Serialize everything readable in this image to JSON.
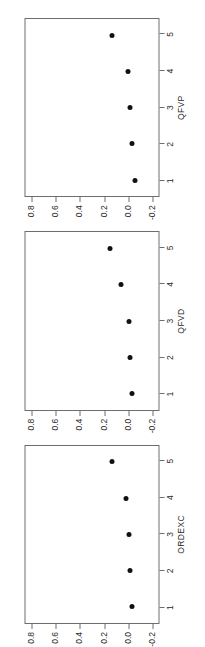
{
  "figure": {
    "orientation": "rotated-90-ccw",
    "background_color": "#ffffff",
    "axis_color": "#6e6e6e",
    "point_color": "#111111"
  },
  "chart_data": [
    {
      "type": "scatter",
      "title": "",
      "xlabel": "ORDEXC",
      "ylabel": "",
      "x": [
        1,
        2,
        3,
        4,
        5
      ],
      "categories": [
        "1",
        "2",
        "3",
        "4",
        "5"
      ],
      "values": [
        -0.04,
        -0.02,
        -0.01,
        0.01,
        0.13
      ],
      "xtick_labels": [
        "1",
        "2",
        "3",
        "4",
        "5"
      ],
      "ytick_labels": [
        "-0.2",
        "0.0",
        "0.2",
        "0.4",
        "0.6",
        "0.8"
      ],
      "ytick_values": [
        -0.2,
        0.0,
        0.2,
        0.4,
        0.6,
        0.8
      ],
      "xlim": [
        0.55,
        5.45
      ],
      "ylim": [
        -0.26,
        0.86
      ],
      "grid": false,
      "legend": false
    },
    {
      "type": "scatter",
      "title": "",
      "xlabel": "QFVD",
      "ylabel": "",
      "x": [
        1,
        2,
        3,
        4,
        5
      ],
      "categories": [
        "1",
        "2",
        "3",
        "4",
        "5"
      ],
      "values": [
        -0.04,
        -0.02,
        -0.01,
        0.06,
        0.15
      ],
      "xtick_labels": [
        "1",
        "2",
        "3",
        "4",
        "5"
      ],
      "ytick_labels": [
        "-0.2",
        "0.0",
        "0.2",
        "0.4",
        "0.6",
        "0.8"
      ],
      "ytick_values": [
        -0.2,
        0.0,
        0.2,
        0.4,
        0.6,
        0.8
      ],
      "xlim": [
        0.55,
        5.45
      ],
      "ylim": [
        -0.26,
        0.86
      ],
      "grid": false,
      "legend": false
    },
    {
      "type": "scatter",
      "title": "",
      "xlabel": "QFVP",
      "ylabel": "",
      "x": [
        1,
        2,
        3,
        4,
        5
      ],
      "categories": [
        "1",
        "2",
        "3",
        "4",
        "5"
      ],
      "values": [
        -0.06,
        -0.04,
        -0.02,
        0.0,
        0.13
      ],
      "xtick_labels": [
        "1",
        "2",
        "3",
        "4",
        "5"
      ],
      "ytick_labels": [
        "-0.2",
        "0.0",
        "0.2",
        "0.4",
        "0.6",
        "0.8"
      ],
      "ytick_values": [
        -0.2,
        0.0,
        0.2,
        0.4,
        0.6,
        0.8
      ],
      "xlim": [
        0.55,
        5.45
      ],
      "ylim": [
        -0.26,
        0.86
      ],
      "grid": false,
      "legend": false
    }
  ]
}
